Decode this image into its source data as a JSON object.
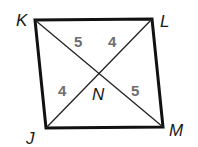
{
  "diagram": {
    "type": "quadrilateral-with-diagonals",
    "vertices": {
      "K": {
        "label": "K",
        "x": 35,
        "y": 20
      },
      "L": {
        "label": "L",
        "x": 152,
        "y": 19
      },
      "M": {
        "label": "M",
        "x": 163,
        "y": 127
      },
      "J": {
        "label": "J",
        "x": 46,
        "y": 128
      }
    },
    "intersection": {
      "label": "N"
    },
    "segments": {
      "KN": "5",
      "LN": "4",
      "JN": "4",
      "MN": "5"
    },
    "colors": {
      "edge": "#111111",
      "diagonal": "#222222",
      "segment_label": "#6d6d6d"
    }
  }
}
